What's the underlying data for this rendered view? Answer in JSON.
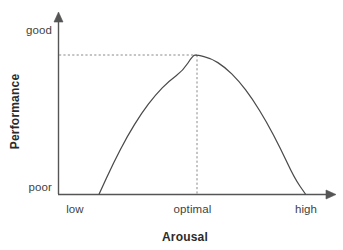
{
  "chart_data": {
    "type": "line",
    "title": "",
    "xlabel": "Arousal",
    "ylabel": "Performance",
    "xtick_labels": [
      "low",
      "optimal",
      "high"
    ],
    "ytick_labels": [
      "poor",
      "good"
    ],
    "xlim": [
      0,
      1
    ],
    "ylim": [
      0,
      1
    ],
    "grid": false,
    "legend": null,
    "annotations": [
      {
        "name": "peak-guide-horizontal",
        "style": "dashed",
        "from": "y-axis",
        "to": "peak"
      },
      {
        "name": "peak-guide-vertical",
        "style": "dashed",
        "from": "peak",
        "to": "x-axis"
      }
    ],
    "series": [
      {
        "name": "Yerkes-Dodson inverted-U",
        "x": [
          0.148,
          0.2,
          0.25,
          0.3,
          0.35,
          0.4,
          0.45,
          0.485,
          0.5,
          0.55,
          0.6,
          0.65,
          0.7,
          0.75,
          0.8,
          0.85,
          0.89
        ],
        "y": [
          0.0,
          0.227,
          0.418,
          0.58,
          0.712,
          0.815,
          0.888,
          0.997,
          1.0,
          0.977,
          0.913,
          0.815,
          0.682,
          0.52,
          0.33,
          0.115,
          0.0
        ]
      }
    ]
  },
  "geometry": {
    "axis_color": "#555555",
    "curve_color": "#4a4a4a",
    "dash_color": "#8a8a8a",
    "background": "#ffffff",
    "origin_x": 58,
    "origin_y": 194,
    "peak_x": 192,
    "peak_y": 55,
    "curve_left_x": 75,
    "curve_right_x": 305,
    "x_axis_arrow_x": 336,
    "y_axis_arrow_y": 13
  },
  "labels": {
    "y_good": "good",
    "y_poor": "poor",
    "x_low": "low",
    "x_optimal": "optimal",
    "x_high": "high",
    "x_title": "Arousal",
    "y_title": "Performance"
  }
}
